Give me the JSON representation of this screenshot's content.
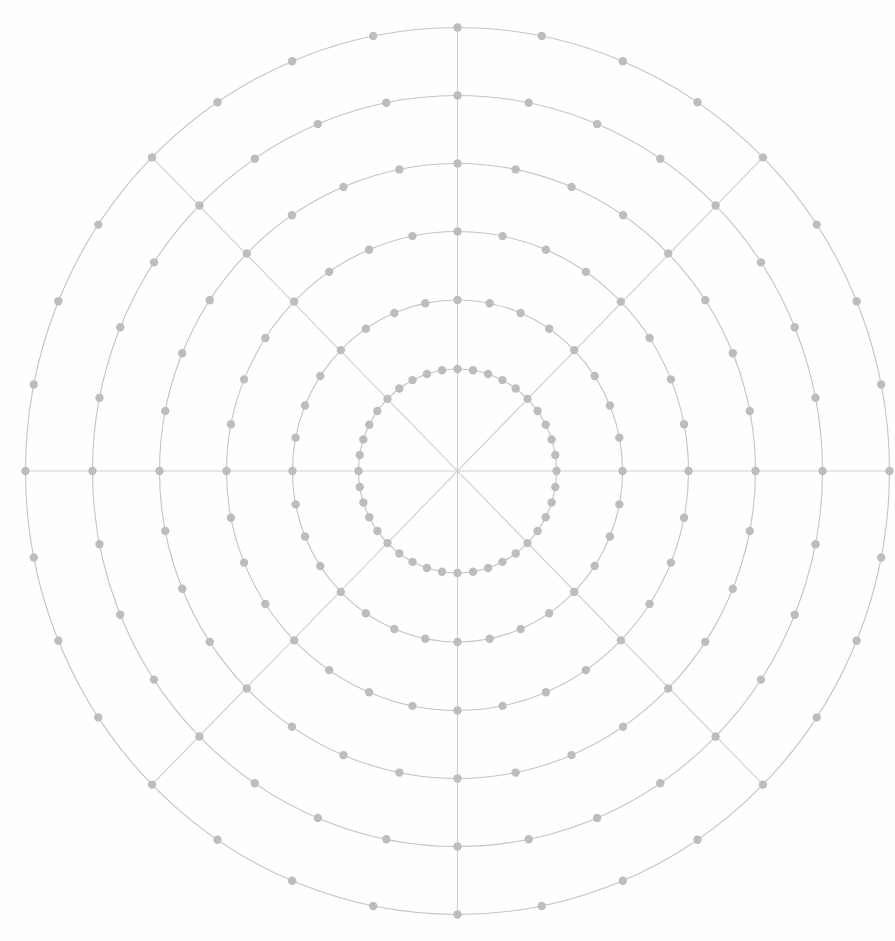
{
  "diagram": {
    "type": "polar-grid",
    "center": {
      "x": 457.5,
      "y": 471
    },
    "colors": {
      "background": "#fefefe",
      "ring_stroke": "#c4c4c4",
      "radial_stroke": "#cfcfcf",
      "dot_fill": "#bdbdbd"
    },
    "dot_radius": 4.2,
    "radial_count": 8,
    "rings": [
      {
        "index": 1,
        "rx": 99,
        "ry": 102,
        "dots_between_radials": 4
      },
      {
        "index": 2,
        "rx": 165,
        "ry": 171,
        "dots_between_radials": 3
      },
      {
        "index": 3,
        "rx": 231,
        "ry": 239.5,
        "dots_between_radials": 3
      },
      {
        "index": 4,
        "rx": 298,
        "ry": 307.5,
        "dots_between_radials": 3
      },
      {
        "index": 5,
        "rx": 365,
        "ry": 375.5,
        "dots_between_radials": 3
      },
      {
        "index": 6,
        "rx": 432,
        "ry": 443.5,
        "dots_between_radials": 3
      }
    ]
  }
}
